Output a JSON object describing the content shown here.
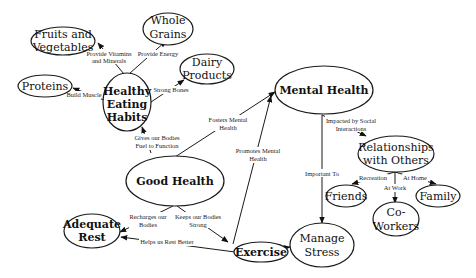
{
  "diagram": {
    "type": "concept-map",
    "nodes": {
      "fruits": {
        "lines": [
          "Fruits and",
          "Vegetables"
        ]
      },
      "grains": {
        "lines": [
          "Whole",
          "Grains"
        ]
      },
      "dairy": {
        "lines": [
          "Dairy",
          "Products"
        ]
      },
      "proteins": {
        "lines": [
          "Proteins"
        ]
      },
      "eating": {
        "lines": [
          "Healthy",
          "Eating",
          "Habits"
        ]
      },
      "mental": {
        "lines": [
          "Mental Health"
        ]
      },
      "relationships": {
        "lines": [
          "Relationships",
          "with Others"
        ]
      },
      "friends": {
        "lines": [
          "Friends"
        ]
      },
      "coworkers": {
        "lines": [
          "Co-",
          "Workers"
        ]
      },
      "family": {
        "lines": [
          "Family"
        ]
      },
      "good": {
        "lines": [
          "Good Health"
        ]
      },
      "rest": {
        "lines": [
          "Adequate",
          "Rest"
        ]
      },
      "exercise": {
        "lines": [
          "Exercise"
        ]
      },
      "stress": {
        "lines": [
          "Manage",
          "Stress"
        ]
      }
    },
    "edges": {
      "vitamins": {
        "from": "Healthy Eating Habits",
        "to": "Fruits and Vegetables",
        "lines": [
          "Provide Vitamins",
          "and Minerals"
        ]
      },
      "energy": {
        "from": "Healthy Eating Habits",
        "to": "Whole Grains",
        "lines": [
          "Provide Energy"
        ]
      },
      "bones": {
        "from": "Healthy Eating Habits",
        "to": "Dairy Products",
        "lines": [
          "Strong Bones"
        ]
      },
      "muscle": {
        "from": "Healthy Eating Habits",
        "to": "Proteins",
        "lines": [
          "Build Muscle"
        ]
      },
      "fuel": {
        "from": "Good Health",
        "to": "Healthy Eating Habits",
        "lines": [
          "Gives our Bodies",
          "Fuel to Function"
        ]
      },
      "fosters": {
        "from": "Good Health",
        "to": "Mental Health",
        "lines": [
          "Fosters Mental",
          "Health"
        ]
      },
      "promotes": {
        "from": "Exercise",
        "to": "Mental Health",
        "lines": [
          "Promotes Mental",
          "Health"
        ]
      },
      "social": {
        "from": "Mental Health",
        "to": "Relationships with Others",
        "lines": [
          "Impacted by Social",
          "Interactions"
        ]
      },
      "important": {
        "from": "Mental Health",
        "to": "Manage Stress",
        "lines": [
          "Important To"
        ]
      },
      "recreation": {
        "from": "Relationships with Others",
        "to": "Friends",
        "lines": [
          "Recreation"
        ]
      },
      "atwork": {
        "from": "Relationships with Others",
        "to": "Co-Workers",
        "lines": [
          "At Work"
        ]
      },
      "athome": {
        "from": "Relationships with Others",
        "to": "Family",
        "lines": [
          "At Home"
        ]
      },
      "recharges": {
        "from": "Good Health",
        "to": "Adequate Rest",
        "lines": [
          "Recharges our",
          "Bodies"
        ]
      },
      "strong": {
        "from": "Good Health",
        "to": "Exercise",
        "lines": [
          "Keeps our Bodies",
          "Strong"
        ]
      },
      "restbetter": {
        "from": "Exercise",
        "to": "Adequate Rest",
        "lines": [
          "Helps us Rest Better"
        ]
      },
      "wayto": {
        "from": "Exercise",
        "to": "Manage Stress",
        "lines": [
          "Way to"
        ]
      }
    }
  }
}
